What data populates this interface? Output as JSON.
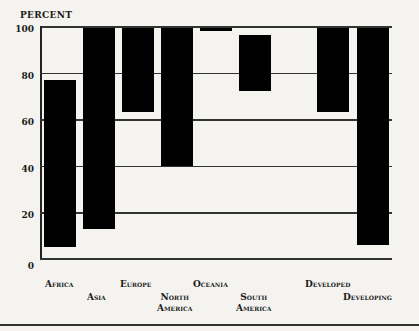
{
  "chart_data": {
    "type": "bar",
    "subtype": "floating-range",
    "title": "",
    "ylabel": "PERCENT",
    "xlabel": "",
    "ylim": [
      0,
      100
    ],
    "yticks": [
      0,
      20,
      40,
      60,
      80,
      100
    ],
    "grid": true,
    "legend": null,
    "categories": [
      "Africa",
      "Asia",
      "Europe",
      "North America",
      "Oceania",
      "South America",
      "Developed",
      "Developing"
    ],
    "series": [
      {
        "name": "low",
        "values": [
          5,
          13,
          63,
          40,
          98,
          72,
          63,
          6
        ]
      },
      {
        "name": "high",
        "values": [
          77,
          99,
          99,
          99,
          99,
          96,
          99,
          99
        ]
      }
    ]
  },
  "labels": {
    "ylabel": "PERCENT",
    "yticks": [
      "0",
      "20",
      "40",
      "60",
      "80",
      "100"
    ],
    "categories": [
      "Africa",
      "Asia",
      "Europe",
      "North\nAmerica",
      "Oceania",
      "South\nAmerica",
      "Developed",
      "Developing"
    ]
  }
}
